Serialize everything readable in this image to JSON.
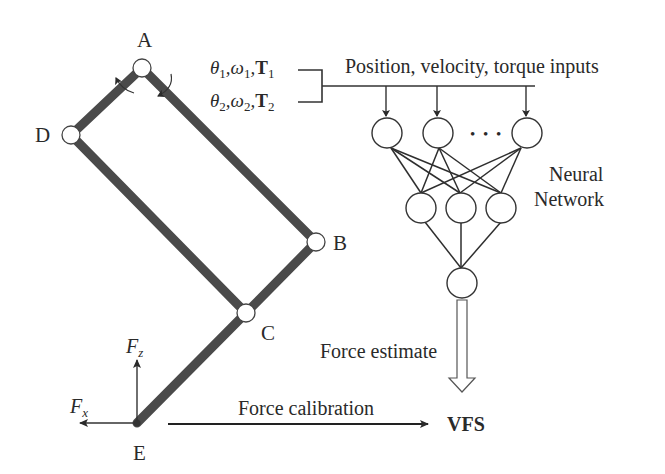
{
  "diagram": {
    "linkage": {
      "joints": [
        {
          "id": "A",
          "label": "A",
          "x": 142,
          "y": 68
        },
        {
          "id": "B",
          "label": "B",
          "x": 316,
          "y": 242
        },
        {
          "id": "C",
          "label": "C",
          "x": 246,
          "y": 313
        },
        {
          "id": "D",
          "label": "D",
          "x": 71,
          "y": 135
        },
        {
          "id": "E",
          "label": "E",
          "x": 137,
          "y": 423
        }
      ],
      "links": [
        [
          "A",
          "D"
        ],
        [
          "A",
          "B"
        ],
        [
          "D",
          "C"
        ],
        [
          "B",
          "C"
        ],
        [
          "C",
          "E"
        ]
      ],
      "force_labels": {
        "fz": {
          "symbol": "F",
          "subscript": "z"
        },
        "fx": {
          "symbol": "F",
          "subscript": "x"
        }
      }
    },
    "inputs": {
      "line1": {
        "theta": "θ",
        "theta_sub": "1",
        "omega": "ω",
        "omega_sub": "1",
        "torque": "T",
        "torque_sub": "1"
      },
      "line2": {
        "theta": "θ",
        "theta_sub": "2",
        "omega": "ω",
        "omega_sub": "2",
        "torque": "T",
        "torque_sub": "2"
      },
      "caption": "Position, velocity, torque inputs"
    },
    "neural_network": {
      "label_line1": "Neural",
      "label_line2": "Network",
      "input_layer_nodes": 3,
      "ellipsis": "• • •",
      "hidden_layer_nodes": 3,
      "output_layer_nodes": 1
    },
    "force_estimate_label": "Force estimate",
    "force_calibration_label": "Force calibration",
    "output_label": "VFS"
  }
}
